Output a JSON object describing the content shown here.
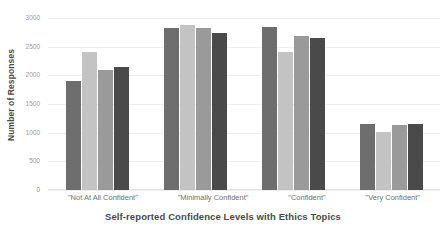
{
  "chart_data": {
    "type": "bar",
    "title": "",
    "xlabel": "Self-reported Confidence Levels with Ethics Topics",
    "ylabel": "Number of Responses",
    "categories": [
      "\"Not At All Confident\"",
      "\"Minimally Confident\"",
      "\"Confident\"",
      "\"Very Confident\""
    ],
    "series": [
      {
        "name": "series-1",
        "color": "#6e6e6e",
        "values": [
          1900,
          2830,
          2850,
          1150
        ]
      },
      {
        "name": "series-2",
        "color": "#c3c3c3",
        "values": [
          2400,
          2880,
          2400,
          1020
        ]
      },
      {
        "name": "series-3",
        "color": "#9a9a9a",
        "values": [
          2090,
          2830,
          2690,
          1130
        ]
      },
      {
        "name": "series-4",
        "color": "#4a4a4a",
        "values": [
          2150,
          2740,
          2650,
          1150
        ]
      }
    ],
    "ylim": [
      0,
      3000
    ],
    "yticks": [
      0,
      500,
      1000,
      1500,
      2000,
      2500,
      3000
    ],
    "ytick_labels": [
      "0",
      "500",
      "1000",
      "1500",
      "2000",
      "2500",
      "3000"
    ],
    "grid": true,
    "legend": "none",
    "background": "#ffffff",
    "grid_color": "#efefef",
    "axis_text_color": "#9a9a9a",
    "label_color": "#4a4a4a"
  }
}
